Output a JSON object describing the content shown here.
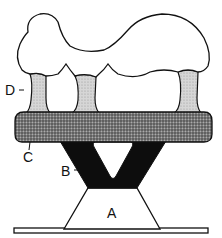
{
  "diagram": {
    "labels": {
      "A": "A",
      "B": "B",
      "C": "C",
      "D": "D"
    },
    "parts": [
      {
        "id": "top-mass",
        "description": "irregular white cloud-like mass on top"
      },
      {
        "id": "D",
        "description": "light stippled columns connecting top mass to band"
      },
      {
        "id": "C",
        "description": "dark stippled horizontal band"
      },
      {
        "id": "B",
        "description": "solid black V-shaped support"
      },
      {
        "id": "A",
        "description": "white trapezoid base"
      },
      {
        "id": "floor",
        "description": "thin horizontal base plate"
      }
    ],
    "colors": {
      "outline": "#111111",
      "column_fill": "#cfcfcf",
      "band_fill": "#7a7a7a",
      "support_fill": "#0d0d0d",
      "background": "#ffffff"
    }
  }
}
